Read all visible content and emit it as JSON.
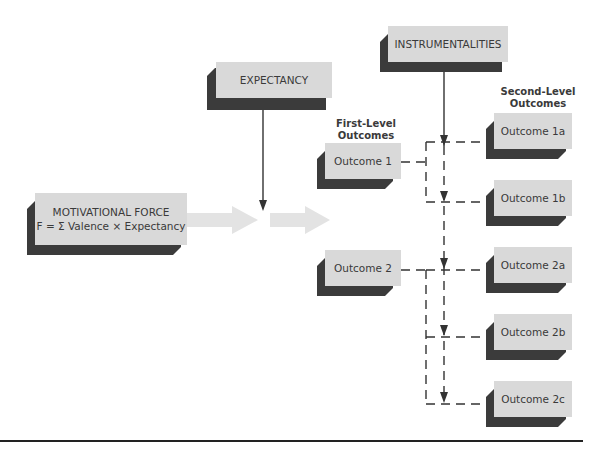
{
  "diagram": {
    "nodes": {
      "expectancy": "EXPECTANCY",
      "instrumentalities": "INSTRUMENTALITIES",
      "motivational_force_line1": "MOTIVATIONAL FORCE",
      "motivational_force_line2": "F = Σ Valence × Expectancy",
      "outcome1": "Outcome 1",
      "outcome2": "Outcome 2",
      "outcome1a": "Outcome 1a",
      "outcome1b": "Outcome 1b",
      "outcome2a": "Outcome 2a",
      "outcome2b": "Outcome 2b",
      "outcome2c": "Outcome 2c"
    },
    "headers": {
      "first_level_1": "First-Level",
      "first_level_2": "Outcomes",
      "second_level_1": "Second-Level",
      "second_level_2": "Outcomes"
    },
    "colors": {
      "box_face": "#d9d9d9",
      "box_shadow": "#3b3b3b",
      "arrow_fill": "#e3e3e3",
      "line": "#333333"
    }
  }
}
